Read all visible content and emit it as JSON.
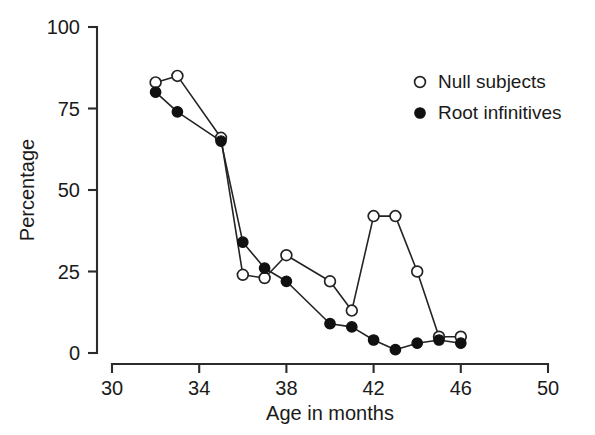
{
  "chart_data": {
    "type": "line",
    "title": "",
    "xlabel": "Age in months",
    "ylabel": "Percentage",
    "xlim": [
      30,
      50
    ],
    "ylim": [
      0,
      100
    ],
    "xticks": [
      30,
      34,
      38,
      42,
      46,
      50
    ],
    "yticks": [
      0,
      25,
      50,
      75,
      100
    ],
    "xtick_labels": [
      "30",
      "34",
      "38",
      "42",
      "46",
      "50"
    ],
    "ytick_labels": [
      "0",
      "25",
      "50",
      "75",
      "100"
    ],
    "grid": false,
    "legend_position": "upper right",
    "series": [
      {
        "name": "Null subjects",
        "marker": "open-circle",
        "x": [
          32,
          33,
          35,
          36,
          37,
          38,
          40,
          41,
          42,
          43,
          44,
          45,
          46
        ],
        "values": [
          83,
          85,
          66,
          24,
          23,
          30,
          22,
          13,
          42,
          42,
          25,
          5,
          5
        ]
      },
      {
        "name": "Root infinitives",
        "marker": "filled-circle",
        "x": [
          32,
          33,
          35,
          36,
          37,
          38,
          40,
          41,
          42,
          43,
          44,
          45,
          46
        ],
        "values": [
          80,
          74,
          65,
          34,
          26,
          22,
          9,
          8,
          4,
          1,
          3,
          4,
          3
        ]
      }
    ]
  },
  "legend": {
    "entries": [
      {
        "label": "Null subjects",
        "marker": "open-circle"
      },
      {
        "label": "Root infinitives",
        "marker": "filled-circle"
      }
    ]
  },
  "colors": {
    "axis": "#2b2b2b",
    "line": "#232323",
    "marker_fill": "#111111",
    "marker_open_fill": "#ffffff",
    "background": "#ffffff"
  }
}
